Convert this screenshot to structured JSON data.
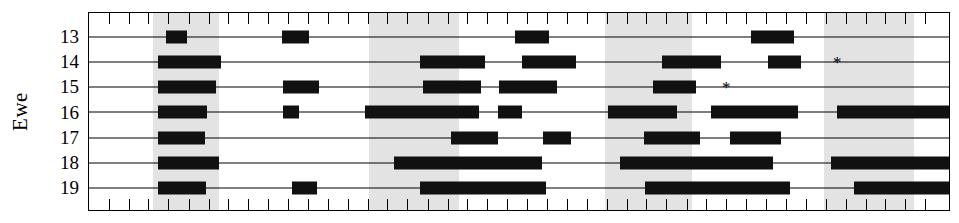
{
  "axis": {
    "ylabel": "Ewe",
    "ytick_labels": [
      "13",
      "14",
      "15",
      "16",
      "17",
      "18",
      "19"
    ]
  },
  "annotations": {
    "asterisk": "*"
  },
  "colors": {
    "bar": "#111111",
    "shaded_band": "#e3e3e3",
    "axis": "#000000",
    "background": "#ffffff"
  },
  "chart_data": {
    "type": "bar",
    "subtype": "horizontal-interval-timeline",
    "title": "",
    "xlabel": "",
    "ylabel": "Ewe",
    "grid": false,
    "legend": null,
    "xlim": [
      0,
      100
    ],
    "x_tick_count": 44,
    "x_tick_positions_pct": [
      2.3,
      4.6,
      6.9,
      9.2,
      11.6,
      13.9,
      16.2,
      18.5,
      20.8,
      23.1,
      25.5,
      27.8,
      30.1,
      32.4,
      34.7,
      37.0,
      39.4,
      41.7,
      44.0,
      46.3,
      48.6,
      50.9,
      53.2,
      55.6,
      57.9,
      60.2,
      62.5,
      64.8,
      67.1,
      69.5,
      71.8,
      74.1,
      76.4,
      78.7,
      81.0,
      83.4,
      85.7,
      88.0,
      90.3,
      92.6,
      94.9,
      97.2
    ],
    "shaded_bands_pct": [
      {
        "start": 7.4,
        "end": 15.1
      },
      {
        "start": 32.5,
        "end": 43.0
      },
      {
        "start": 60.0,
        "end": 70.1
      },
      {
        "start": 85.5,
        "end": 95.9
      }
    ],
    "categories": [
      "13",
      "14",
      "15",
      "16",
      "17",
      "18",
      "19"
    ],
    "series": [
      {
        "name": "13",
        "bouts_pct": [
          {
            "start": 9.0,
            "end": 11.4
          },
          {
            "start": 22.4,
            "end": 25.6
          },
          {
            "start": 49.5,
            "end": 53.5
          },
          {
            "start": 77.0,
            "end": 82.0
          }
        ],
        "asterisk_pct": null
      },
      {
        "name": "14",
        "bouts_pct": [
          {
            "start": 8.0,
            "end": 15.4
          },
          {
            "start": 38.5,
            "end": 46.0
          },
          {
            "start": 50.4,
            "end": 56.6
          },
          {
            "start": 66.6,
            "end": 73.5
          },
          {
            "start": 79.0,
            "end": 82.8
          }
        ],
        "asterisk_pct": 86.5
      },
      {
        "name": "15",
        "bouts_pct": [
          {
            "start": 8.0,
            "end": 14.8
          },
          {
            "start": 22.5,
            "end": 26.8
          },
          {
            "start": 38.8,
            "end": 45.6
          },
          {
            "start": 47.7,
            "end": 54.4
          },
          {
            "start": 65.6,
            "end": 70.6
          }
        ],
        "asterisk_pct": 73.6
      },
      {
        "name": "16",
        "bouts_pct": [
          {
            "start": 8.0,
            "end": 13.7
          },
          {
            "start": 22.6,
            "end": 24.4
          },
          {
            "start": 32.1,
            "end": 45.3
          },
          {
            "start": 47.6,
            "end": 50.4
          },
          {
            "start": 60.3,
            "end": 68.4
          },
          {
            "start": 72.3,
            "end": 82.5
          },
          {
            "start": 87.0,
            "end": 100.0
          }
        ],
        "asterisk_pct": null
      },
      {
        "name": "17",
        "bouts_pct": [
          {
            "start": 8.0,
            "end": 13.5
          },
          {
            "start": 42.1,
            "end": 47.6
          },
          {
            "start": 52.8,
            "end": 56.0
          },
          {
            "start": 64.5,
            "end": 71.0
          },
          {
            "start": 74.5,
            "end": 80.5
          }
        ],
        "asterisk_pct": null
      },
      {
        "name": "18",
        "bouts_pct": [
          {
            "start": 8.0,
            "end": 15.1
          },
          {
            "start": 35.5,
            "end": 52.7
          },
          {
            "start": 61.7,
            "end": 79.5
          },
          {
            "start": 86.3,
            "end": 100.0
          }
        ],
        "asterisk_pct": null
      },
      {
        "name": "19",
        "bouts_pct": [
          {
            "start": 8.0,
            "end": 13.6
          },
          {
            "start": 23.6,
            "end": 26.5
          },
          {
            "start": 38.5,
            "end": 53.1
          },
          {
            "start": 64.6,
            "end": 81.5
          },
          {
            "start": 89.0,
            "end": 100.0
          }
        ],
        "asterisk_pct": null
      }
    ]
  }
}
